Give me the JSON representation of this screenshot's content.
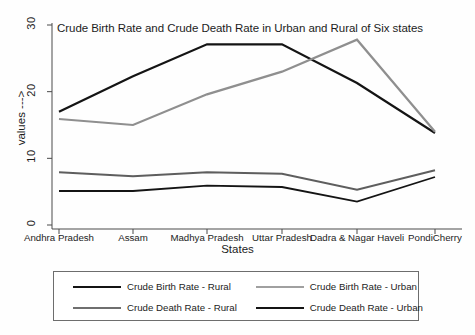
{
  "chart_data": {
    "type": "line",
    "title": "Crude Birth Rate and Crude Death Rate in Urban and Rural of Six states",
    "xlabel": "States",
    "ylabel": "values --->",
    "categories": [
      "Andhra Pradesh",
      "Assam",
      "Madhya Pradesh",
      "Uttar Pradesh",
      "Dadra & Nagar Haveli",
      "PondiCherry"
    ],
    "yticks": [
      0,
      10,
      20,
      30
    ],
    "ylim": [
      0,
      31
    ],
    "grid": false,
    "legend_position": "bottom",
    "series": [
      {
        "name": "Crude Birth Rate - Rural",
        "color": "#141414",
        "width": 2.2,
        "values": [
          17.0,
          22.3,
          27.1,
          27.1,
          21.3,
          13.8
        ]
      },
      {
        "name": "Crude Birth Rate - Urban",
        "color": "#8f8f8f",
        "width": 2.2,
        "values": [
          15.9,
          15.0,
          19.6,
          23.0,
          27.8,
          14.0
        ]
      },
      {
        "name": "Crude Death Rate - Rural",
        "color": "#5e5e5e",
        "width": 2.0,
        "values": [
          7.9,
          7.3,
          7.9,
          7.7,
          5.3,
          8.2
        ]
      },
      {
        "name": "Crude Death Rate - Urban",
        "color": "#141414",
        "width": 1.8,
        "values": [
          5.1,
          5.1,
          5.9,
          5.7,
          3.5,
          7.2
        ]
      }
    ]
  },
  "legend": {
    "entries": [
      {
        "label": "Crude Birth Rate - Rural",
        "color": "#141414",
        "width": 2.6
      },
      {
        "label": "Crude Birth Rate - Urban",
        "color": "#a0a0a0",
        "width": 2.2
      },
      {
        "label": "Crude Death Rate - Rural",
        "color": "#6f6f6f",
        "width": 2.2
      },
      {
        "label": "Crude Death Rate - Urban",
        "color": "#141414",
        "width": 2.6
      }
    ]
  },
  "axis": {
    "y_tick_labels": [
      "0",
      "10",
      "20",
      "30"
    ],
    "x_tick_labels": [
      "Andhra Pradesh",
      "Assam",
      "Madhya Pradesh",
      "Uttar Pradesh",
      "Dadra & Nagar Haveli",
      "PondiCherry"
    ]
  }
}
